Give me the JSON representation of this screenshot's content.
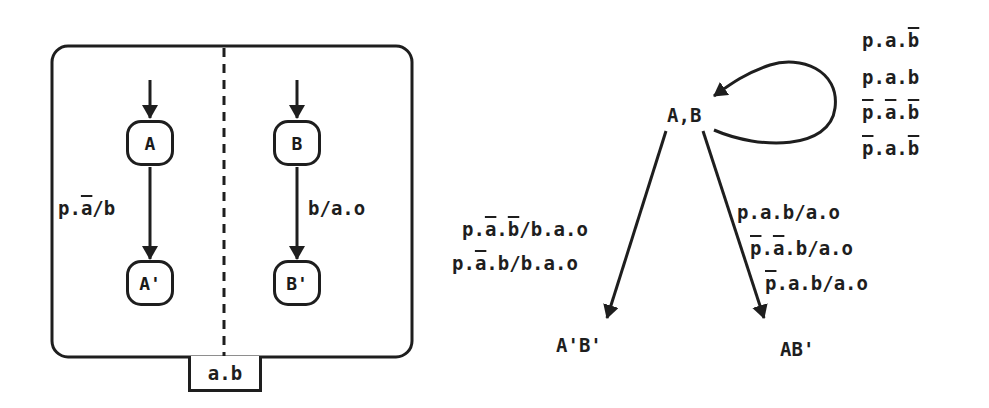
{
  "left_diagram": {
    "nodes": {
      "A": "A",
      "B": "B",
      "A_prime": "A'",
      "B_prime": "B'"
    },
    "transitions": {
      "A_to_A_prime": {
        "parts": [
          "p.",
          "a",
          "/b"
        ],
        "overlined": [
          false,
          true,
          false
        ]
      },
      "B_to_B_prime": "b/a.o"
    },
    "condition_label": "a.b"
  },
  "right_diagram": {
    "initial_state": "A,B",
    "self_loop_labels": [
      {
        "parts": [
          "p",
          ".",
          "a",
          ".",
          "b"
        ],
        "overlined": [
          false,
          false,
          false,
          false,
          true
        ]
      },
      {
        "parts": [
          "p",
          ".",
          "a",
          ".",
          "b"
        ],
        "overlined": [
          false,
          false,
          false,
          false,
          false
        ]
      },
      {
        "parts": [
          "p",
          ".",
          "a",
          ".",
          "b"
        ],
        "overlined": [
          true,
          false,
          true,
          false,
          true
        ]
      },
      {
        "parts": [
          "p",
          ".",
          "a",
          ".",
          "b"
        ],
        "overlined": [
          true,
          false,
          false,
          false,
          true
        ]
      }
    ],
    "left_branch_labels": [
      {
        "parts": [
          "p.",
          "a",
          ".",
          "b",
          "/b.a.o"
        ],
        "overlined": [
          false,
          true,
          false,
          true,
          false
        ]
      },
      {
        "parts": [
          "p.",
          "a",
          ".b/b.a.o"
        ],
        "overlined": [
          false,
          true,
          false
        ]
      }
    ],
    "right_branch_labels": [
      {
        "parts": [
          "p.a.b/a.o"
        ],
        "overlined": [
          false
        ]
      },
      {
        "parts": [
          "p",
          ".",
          "a",
          ".b/a.o"
        ],
        "overlined": [
          true,
          false,
          true,
          false
        ]
      },
      {
        "parts": [
          "p",
          ".a.b/a.o"
        ],
        "overlined": [
          true,
          false
        ]
      }
    ],
    "target_left": "A'B'",
    "target_right": "AB'"
  },
  "colors": {
    "ink": "#1e1e1e",
    "background": "#ffffff"
  }
}
